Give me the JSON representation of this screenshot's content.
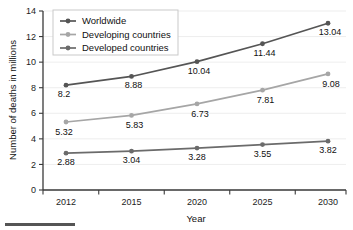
{
  "chart_data": {
    "type": "line",
    "title": "",
    "xlabel": "Year",
    "ylabel": "Number of deaths in millions",
    "categories": [
      "2012",
      "2015",
      "2020",
      "2025",
      "2030"
    ],
    "x": [
      2012,
      2015,
      2020,
      2025,
      2030
    ],
    "ylim": [
      0,
      14
    ],
    "yticks": [
      0,
      2,
      4,
      6,
      8,
      10,
      12,
      14
    ],
    "ytick_labels": [
      "0",
      "2",
      "4",
      "6",
      "8",
      "10",
      "12",
      "14"
    ],
    "grid": "horizontal",
    "legend_position": "top-left",
    "series": [
      {
        "name": "Worldwide",
        "color": "#555555",
        "values": [
          8.2,
          8.88,
          10.04,
          11.44,
          13.04
        ],
        "labels": [
          "8.2",
          "8.88",
          "10.04",
          "11.44",
          "13.04"
        ]
      },
      {
        "name": "Developing countries",
        "color": "#a6a6a6",
        "values": [
          5.32,
          5.83,
          6.73,
          7.81,
          9.08
        ],
        "labels": [
          "5.32",
          "5.83",
          "6.73",
          "7.81",
          "9.08"
        ]
      },
      {
        "name": "Developed countries",
        "color": "#6b6b6b",
        "values": [
          2.88,
          3.04,
          3.28,
          3.55,
          3.82
        ],
        "labels": [
          "2.88",
          "3.04",
          "3.28",
          "3.55",
          "3.82"
        ]
      }
    ]
  },
  "axes": {
    "x_title": "Year",
    "y_title": "Number of deaths in millions"
  },
  "legend": {
    "items": [
      {
        "label": "Worldwide"
      },
      {
        "label": "Developing countries"
      },
      {
        "label": "Developed countries"
      }
    ]
  }
}
